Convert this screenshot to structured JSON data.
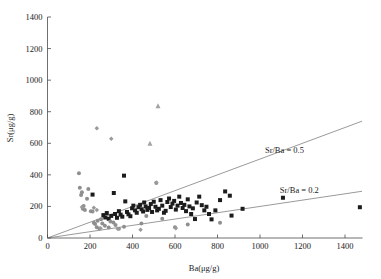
{
  "chart_data": {
    "type": "scatter",
    "title": "",
    "xlabel": "Ba(μg/g)",
    "ylabel": "Sr(μg/g)",
    "xlim": [
      0,
      1480
    ],
    "ylim": [
      0,
      1400
    ],
    "xticks": [
      0,
      200,
      400,
      600,
      800,
      1000,
      1200,
      1400
    ],
    "yticks": [
      0,
      200,
      400,
      600,
      800,
      1000,
      1200,
      1400
    ],
    "grid": false,
    "legend": "none",
    "series": [
      {
        "name": "dark-squares",
        "marker": "square",
        "color": "#1c1c1c",
        "size": 4.0,
        "points": [
          [
            212,
            275
          ],
          [
            263,
            145
          ],
          [
            272,
            130
          ],
          [
            279,
            158
          ],
          [
            288,
            122
          ],
          [
            300,
            140
          ],
          [
            312,
            285
          ],
          [
            318,
            152
          ],
          [
            327,
            128
          ],
          [
            336,
            170
          ],
          [
            344,
            148
          ],
          [
            352,
            135
          ],
          [
            360,
            395
          ],
          [
            366,
            232
          ],
          [
            374,
            165
          ],
          [
            381,
            150
          ],
          [
            390,
            138
          ],
          [
            398,
            188
          ],
          [
            404,
            205
          ],
          [
            412,
            175
          ],
          [
            420,
            160
          ],
          [
            428,
            195
          ],
          [
            436,
            210
          ],
          [
            443,
            182
          ],
          [
            450,
            168
          ],
          [
            455,
            225
          ],
          [
            462,
            200
          ],
          [
            470,
            178
          ],
          [
            478,
            190
          ],
          [
            486,
            215
          ],
          [
            492,
            165
          ],
          [
            500,
            230
          ],
          [
            508,
            198
          ],
          [
            516,
            175
          ],
          [
            524,
            185
          ],
          [
            532,
            240
          ],
          [
            540,
            205
          ],
          [
            548,
            160
          ],
          [
            556,
            172
          ],
          [
            564,
            228
          ],
          [
            572,
            250
          ],
          [
            580,
            196
          ],
          [
            588,
            218
          ],
          [
            596,
            235
          ],
          [
            604,
            180
          ],
          [
            612,
            205
          ],
          [
            620,
            262
          ],
          [
            628,
            222
          ],
          [
            636,
            190
          ],
          [
            644,
            210
          ],
          [
            652,
            170
          ],
          [
            660,
            245
          ],
          [
            668,
            200
          ],
          [
            676,
            152
          ],
          [
            684,
            188
          ],
          [
            694,
            120
          ],
          [
            702,
            225
          ],
          [
            714,
            262
          ],
          [
            726,
            208
          ],
          [
            738,
            175
          ],
          [
            748,
            198
          ],
          [
            760,
            152
          ],
          [
            772,
            118
          ],
          [
            790,
            175
          ],
          [
            812,
            240
          ],
          [
            836,
            295
          ],
          [
            858,
            268
          ],
          [
            866,
            142
          ],
          [
            918,
            185
          ],
          [
            1108,
            255
          ],
          [
            1470,
            195
          ]
        ]
      },
      {
        "name": "gray-circles",
        "marker": "circle",
        "color": "#8f8f8f",
        "size": 4.0,
        "points": [
          [
            148,
            410
          ],
          [
            152,
            318
          ],
          [
            158,
            272
          ],
          [
            162,
            290
          ],
          [
            166,
            186
          ],
          [
            170,
            202
          ],
          [
            176,
            178
          ],
          [
            186,
            248
          ],
          [
            192,
            310
          ],
          [
            204,
            170
          ],
          [
            212,
            168
          ],
          [
            218,
            96
          ],
          [
            224,
            88
          ],
          [
            232,
            68
          ],
          [
            236,
            110
          ],
          [
            244,
            60
          ],
          [
            252,
            118
          ],
          [
            258,
            92
          ],
          [
            270,
            78
          ],
          [
            288,
            66
          ],
          [
            296,
            104
          ],
          [
            310,
            98
          ],
          [
            320,
            82
          ],
          [
            336,
            58
          ],
          [
            360,
            72
          ],
          [
            442,
            92
          ],
          [
            465,
            140
          ],
          [
            512,
            348
          ],
          [
            540,
            122
          ],
          [
            600,
            68
          ],
          [
            660,
            86
          ],
          [
            812,
            96
          ]
        ]
      },
      {
        "name": "gray-diamonds",
        "marker": "diamond",
        "color": "#9a9a9a",
        "size": 4.5,
        "points": [
          [
            232,
            695
          ],
          [
            300,
            628
          ],
          [
            162,
            196
          ],
          [
            218,
            192
          ],
          [
            232,
            178
          ],
          [
            250,
            62
          ],
          [
            330,
            58
          ],
          [
            438,
            52
          ],
          [
            512,
            352
          ],
          [
            604,
            62
          ]
        ]
      },
      {
        "name": "gray-triangles",
        "marker": "triangle",
        "color": "#a3a3a3",
        "size": 5.0,
        "points": [
          [
            520,
            838
          ],
          [
            482,
            600
          ]
        ]
      }
    ],
    "reference_lines": [
      {
        "name": "sr-ba-0.5",
        "label": "Sr/Ba = 0.5",
        "slope": 0.5,
        "intercept": 0,
        "label_x": 1115,
        "label_y": 540,
        "color": "#6e6e6e"
      },
      {
        "name": "sr-ba-0.2",
        "label": "Sr/Ba = 0.2",
        "slope": 0.2,
        "intercept": 0,
        "label_x": 1185,
        "label_y": 282,
        "color": "#6e6e6e"
      }
    ]
  },
  "axes": {
    "x_title": "Ba(μg/g)",
    "y_title": "Sr(μg/g)",
    "x_tick_labels": [
      "0",
      "200",
      "400",
      "600",
      "800",
      "1000",
      "1200",
      "1400"
    ],
    "y_tick_labels": [
      "0",
      "200",
      "400",
      "600",
      "800",
      "1000",
      "1200",
      "1400"
    ]
  },
  "annotations": {
    "line_high": "Sr/Ba = 0.5",
    "line_low": "Sr/Ba = 0.2"
  },
  "colors": {
    "axis": "#4a4a4a",
    "text": "#1a1a1a",
    "square_marker": "#1c1c1c",
    "circle_marker": "#8f8f8f",
    "diamond_marker": "#9a9a9a",
    "triangle_marker": "#a3a3a3",
    "ratio_line": "#6e6e6e",
    "background": "#ffffff"
  }
}
